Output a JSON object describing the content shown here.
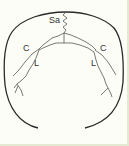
{
  "diagram": {
    "labels": {
      "sagittal": "Sa",
      "coronal_left": "C",
      "coronal_right": "C",
      "lambdoid_left": "L",
      "lambdoid_right": "L"
    },
    "colors": {
      "stroke": "#2a2a2a",
      "suture": "#555555",
      "border": "#e4ead2",
      "background": "#fdfdf8"
    }
  }
}
